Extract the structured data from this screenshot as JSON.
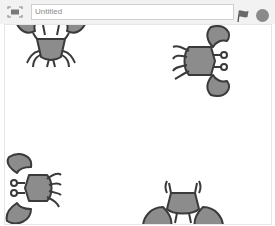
{
  "topbar": {
    "title_value": "Untitled",
    "fullscreen_icon": "fullscreen-icon",
    "green_flag_icon": "green-flag-icon",
    "stop_icon": "stop-icon"
  },
  "stage": {
    "sprites": [
      {
        "name": "crab-1",
        "rotation": 0,
        "icon": "crab-icon"
      },
      {
        "name": "crab-2",
        "rotation": 90,
        "icon": "crab-icon"
      },
      {
        "name": "crab-3",
        "rotation": -90,
        "icon": "crab-icon"
      },
      {
        "name": "crab-4",
        "rotation": 180,
        "icon": "crab-icon"
      }
    ]
  },
  "colors": {
    "crab_fill": "#8c8c8c",
    "crab_stroke": "#3a3a3a",
    "toolbar_bg": "#f2f2f2",
    "icon_gray": "#8a8a8a"
  }
}
